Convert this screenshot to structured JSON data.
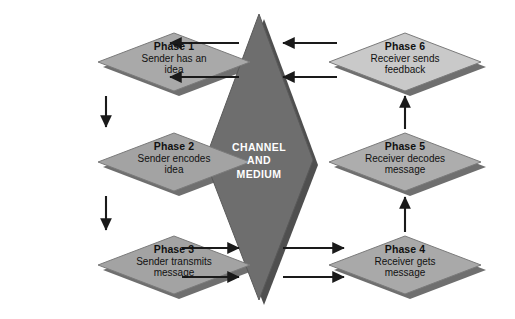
{
  "diagram": {
    "palette": {
      "background": "#ffffff",
      "node_fill_dark": "#9e9e9e",
      "node_fill_mid": "#a9a9a9",
      "node_fill_light": "#c9c9c9",
      "node_edge": "#7b7b7b",
      "node_shadow": "#6f6f6f",
      "center_fill": "#6e6e6e",
      "center_edge": "#555555",
      "center_shadow": "#4f4f4f",
      "arrow": "#1a1a1a",
      "text_dark": "#111111",
      "text_light": "#ffffff"
    },
    "center": {
      "name": "channel-and-medium",
      "lines": [
        "CHANNEL",
        "AND",
        "MEDIUM"
      ],
      "fill": "#6e6e6e",
      "shape": "diamond"
    },
    "nodes": [
      {
        "id": "phase-1",
        "title": "Phase 1",
        "line1": "Sender has an",
        "line2": "idea",
        "fill": "#a9a9a9",
        "side": "left",
        "row": 1
      },
      {
        "id": "phase-2",
        "title": "Phase 2",
        "line1": "Sender encodes",
        "line2": "idea",
        "fill": "#a3a3a3",
        "side": "left",
        "row": 2
      },
      {
        "id": "phase-3",
        "title": "Phase 3",
        "line1": "Sender transmits",
        "line2": "message",
        "fill": "#a3a3a3",
        "side": "left",
        "row": 3
      },
      {
        "id": "phase-4",
        "title": "Phase 4",
        "line1": "Receiver gets",
        "line2": "message",
        "fill": "#a9a9a9",
        "side": "right",
        "row": 3
      },
      {
        "id": "phase-5",
        "title": "Phase 5",
        "line1": "Receiver decodes",
        "line2": "message",
        "fill": "#adadad",
        "side": "right",
        "row": 2
      },
      {
        "id": "phase-6",
        "title": "Phase 6",
        "line1": "Receiver sends",
        "line2": "feedback",
        "fill": "#c9c9c9",
        "side": "right",
        "row": 1
      }
    ],
    "connectors": [
      {
        "id": "arrow-phase1-to-phase2",
        "from": "phase-1",
        "to": "phase-2",
        "direction": "down"
      },
      {
        "id": "arrow-phase2-to-phase3",
        "from": "phase-2",
        "to": "phase-3",
        "direction": "down"
      },
      {
        "id": "arrow-phase3-to-channel-upper",
        "from": "phase-3",
        "to": "channel-and-medium",
        "direction": "right"
      },
      {
        "id": "arrow-phase3-to-channel-lower",
        "from": "phase-3",
        "to": "channel-and-medium",
        "direction": "right"
      },
      {
        "id": "arrow-channel-to-phase4-upper",
        "from": "channel-and-medium",
        "to": "phase-4",
        "direction": "right"
      },
      {
        "id": "arrow-channel-to-phase4-lower",
        "from": "channel-and-medium",
        "to": "phase-4",
        "direction": "right"
      },
      {
        "id": "arrow-phase4-to-phase5",
        "from": "phase-4",
        "to": "phase-5",
        "direction": "up"
      },
      {
        "id": "arrow-phase5-to-phase6",
        "from": "phase-5",
        "to": "phase-6",
        "direction": "up"
      },
      {
        "id": "arrow-phase6-to-channel-upper",
        "from": "phase-6",
        "to": "channel-and-medium",
        "direction": "left"
      },
      {
        "id": "arrow-phase6-to-channel-lower",
        "from": "phase-6",
        "to": "channel-and-medium",
        "direction": "left"
      },
      {
        "id": "arrow-channel-to-phase1-upper",
        "from": "channel-and-medium",
        "to": "phase-1",
        "direction": "left"
      },
      {
        "id": "arrow-channel-to-phase1-lower",
        "from": "channel-and-medium",
        "to": "phase-1",
        "direction": "left"
      }
    ]
  }
}
